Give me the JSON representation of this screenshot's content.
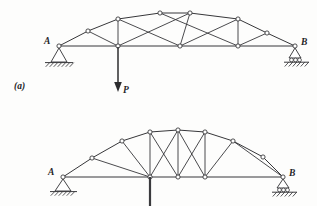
{
  "figure": {
    "part_label": "(a)",
    "background_color": "#fdfdfc",
    "line_color": "#37373a",
    "joint_fill": "#ffffff",
    "panels": [
      {
        "name": "upper-truss",
        "support_left_label": "A",
        "support_left_type": "pin",
        "support_right_label": "B",
        "support_right_type": "roller",
        "load_label": "P",
        "load_direction": "down",
        "top_chord_nodes": [
          [
            59,
            46
          ],
          [
            88,
            31
          ],
          [
            118,
            19
          ],
          [
            160,
            13
          ],
          [
            190,
            13
          ],
          [
            238,
            19
          ],
          [
            267,
            33
          ],
          [
            295,
            46
          ]
        ],
        "bottom_chord_nodes": [
          [
            59,
            46
          ],
          [
            118,
            46
          ],
          [
            180,
            46
          ],
          [
            238,
            46
          ],
          [
            295,
            46
          ]
        ],
        "verticals": [
          [
            [
              118,
              19
            ],
            [
              118,
              46
            ]
          ],
          [
            [
              238,
              19
            ],
            [
              238,
              46
            ]
          ]
        ],
        "diagonals": [
          [
            [
              59,
              46
            ],
            [
              88,
              31
            ]
          ],
          [
            [
              88,
              31
            ],
            [
              118,
              46
            ]
          ],
          [
            [
              118,
              19
            ],
            [
              160,
              13
            ]
          ],
          [
            [
              118,
              46
            ],
            [
              190,
              13
            ]
          ],
          [
            [
              118,
              19
            ],
            [
              180,
              46
            ]
          ],
          [
            [
              180,
              46
            ],
            [
              190,
              13
            ]
          ],
          [
            [
              160,
              13
            ],
            [
              238,
              46
            ]
          ],
          [
            [
              190,
              13
            ],
            [
              238,
              19
            ]
          ],
          [
            [
              238,
              19
            ],
            [
              267,
              33
            ]
          ],
          [
            [
              238,
              46
            ],
            [
              267,
              33
            ]
          ],
          [
            [
              267,
              33
            ],
            [
              295,
              46
            ]
          ]
        ]
      },
      {
        "name": "lower-truss",
        "support_left_label": "A",
        "support_left_type": "pin",
        "support_right_label": "B",
        "support_right_type": "roller",
        "column_label": "",
        "top_chord_nodes": [
          [
            63,
            177
          ],
          [
            92,
            158
          ],
          [
            122,
            141
          ],
          [
            150,
            132
          ],
          [
            178,
            130
          ],
          [
            205,
            132
          ],
          [
            233,
            141
          ],
          [
            263,
            157
          ],
          [
            283,
            177
          ]
        ],
        "bottom_chord_nodes": [
          [
            63,
            177
          ],
          [
            150,
            177
          ],
          [
            178,
            177
          ],
          [
            205,
            177
          ],
          [
            283,
            177
          ]
        ],
        "verticals": [
          [
            [
              150,
              132
            ],
            [
              150,
              177
            ]
          ],
          [
            [
              178,
              130
            ],
            [
              178,
              177
            ]
          ],
          [
            [
              205,
              132
            ],
            [
              205,
              177
            ]
          ]
        ],
        "diagonals": [
          [
            [
              63,
              177
            ],
            [
              92,
              158
            ]
          ],
          [
            [
              92,
              158
            ],
            [
              150,
              177
            ]
          ],
          [
            [
              122,
              141
            ],
            [
              150,
              132
            ]
          ],
          [
            [
              122,
              141
            ],
            [
              150,
              177
            ]
          ],
          [
            [
              150,
              132
            ],
            [
              178,
              177
            ]
          ],
          [
            [
              178,
              130
            ],
            [
              150,
              177
            ]
          ],
          [
            [
              178,
              130
            ],
            [
              205,
              177
            ]
          ],
          [
            [
              205,
              132
            ],
            [
              178,
              177
            ]
          ],
          [
            [
              205,
              132
            ],
            [
              233,
              141
            ]
          ],
          [
            [
              233,
              141
            ],
            [
              205,
              177
            ]
          ],
          [
            [
              233,
              141
            ],
            [
              283,
              177
            ]
          ],
          [
            [
              263,
              157
            ],
            [
              283,
              177
            ]
          ]
        ]
      }
    ]
  }
}
